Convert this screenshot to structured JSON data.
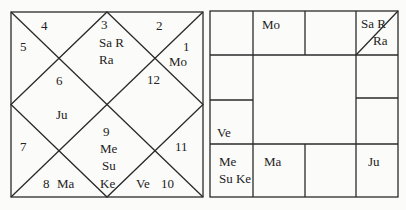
{
  "north_chart": {
    "houses": [
      {
        "num": "1",
        "planets": [
          "Mo"
        ]
      },
      {
        "num": "2",
        "planets": []
      },
      {
        "num": "3",
        "planets": [
          "Sa R",
          "Ra"
        ]
      },
      {
        "num": "4",
        "planets": []
      },
      {
        "num": "5",
        "planets": []
      },
      {
        "num": "6",
        "planets": [
          "Ju"
        ]
      },
      {
        "num": "7",
        "planets": []
      },
      {
        "num": "8",
        "planets": [
          "Ma"
        ]
      },
      {
        "num": "9",
        "planets": [
          "Me",
          "Su",
          "Ke"
        ]
      },
      {
        "num": "10",
        "planets": [
          "Ve"
        ]
      },
      {
        "num": "11",
        "planets": []
      },
      {
        "num": "12",
        "planets": []
      }
    ]
  },
  "south_chart": {
    "cells": {
      "top_1": "",
      "top_2": "Mo",
      "top_3": "",
      "top_4_a": "Sa R",
      "top_4_b": "Ra",
      "left_2": "",
      "left_3": "Ve",
      "right_2": "",
      "right_3": "",
      "bottom_1_a": "Me",
      "bottom_1_b": "Su Ke",
      "bottom_2": "Ma",
      "bottom_3": "",
      "bottom_4": "Ju"
    }
  },
  "colors": {
    "line": "#2a2a2a",
    "background": "#fbfbf9"
  }
}
